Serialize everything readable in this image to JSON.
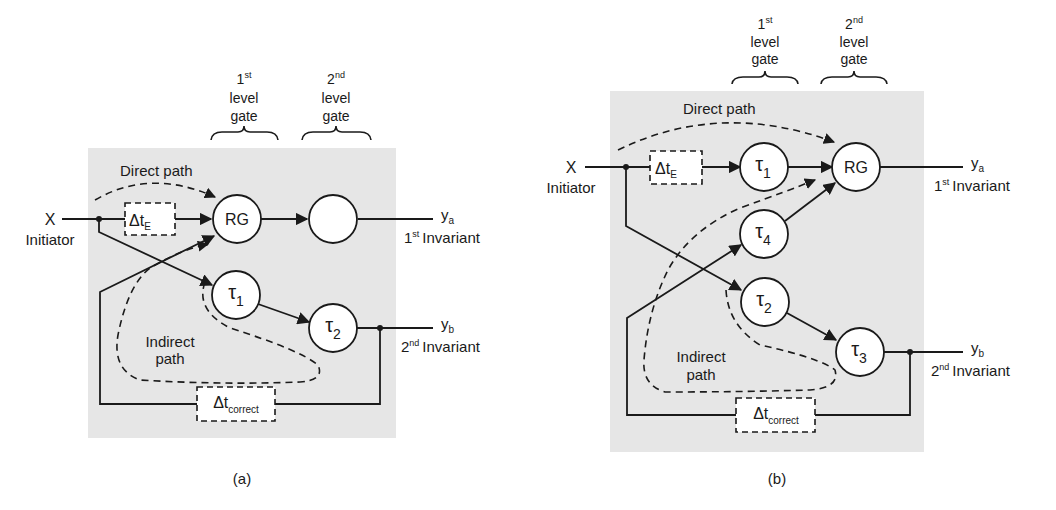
{
  "colors": {
    "panel_bg": "#e6e6e6",
    "line": "#1a1a1a",
    "node_fill": "#ffffff"
  },
  "panels": [
    {
      "caption": "(a)",
      "gate_labels": [
        {
          "ordinal": "1",
          "sup": "st",
          "line1": "level",
          "line2": "gate"
        },
        {
          "ordinal": "2",
          "sup": "nd",
          "line1": "level",
          "line2": "gate"
        }
      ],
      "input": {
        "symbol": "X",
        "label": "Initiator"
      },
      "direct_path_label": "Direct path",
      "indirect_path_label_1": "Indirect",
      "indirect_path_label_2": "path",
      "delay_e": {
        "main": "Δt",
        "sub": "E"
      },
      "delay_correct": {
        "main": "Δt",
        "sub": "correct"
      },
      "nodes": {
        "rg": "RG",
        "gate2": "",
        "tau1": {
          "main": "τ",
          "sub": "1"
        },
        "tau2": {
          "main": "τ",
          "sub": "2"
        }
      },
      "outputs": {
        "ya": {
          "main": "y",
          "sub": "a",
          "ord": "1",
          "sup": "st",
          "label": "Invariant"
        },
        "yb": {
          "main": "y",
          "sub": "b",
          "ord": "2",
          "sup": "nd",
          "label": "Invariant"
        }
      }
    },
    {
      "caption": "(b)",
      "gate_labels": [
        {
          "ordinal": "1",
          "sup": "st",
          "line1": "level",
          "line2": "gate"
        },
        {
          "ordinal": "2",
          "sup": "nd",
          "line1": "level",
          "line2": "gate"
        }
      ],
      "input": {
        "symbol": "X",
        "label": "Initiator"
      },
      "direct_path_label": "Direct path",
      "indirect_path_label_1": "Indirect",
      "indirect_path_label_2": "path",
      "delay_e": {
        "main": "Δt",
        "sub": "E"
      },
      "delay_correct": {
        "main": "Δt",
        "sub": "correct"
      },
      "nodes": {
        "rg": "RG",
        "tau1": {
          "main": "τ",
          "sub": "1"
        },
        "tau2": {
          "main": "τ",
          "sub": "2"
        },
        "tau3": {
          "main": "τ",
          "sub": "3"
        },
        "tau4": {
          "main": "τ",
          "sub": "4"
        }
      },
      "outputs": {
        "ya": {
          "main": "y",
          "sub": "a",
          "ord": "1",
          "sup": "st",
          "label": "Invariant"
        },
        "yb": {
          "main": "y",
          "sub": "b",
          "ord": "2",
          "sup": "nd",
          "label": "Invariant"
        }
      }
    }
  ]
}
